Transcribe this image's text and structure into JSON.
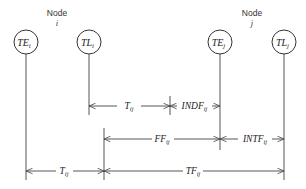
{
  "nodes": [
    {
      "id": "i",
      "label": "Node",
      "sub": "i"
    },
    {
      "id": "j",
      "label": "Node",
      "sub": "j"
    }
  ],
  "events": [
    {
      "id": "TE_i",
      "main": "TE",
      "sub": "i"
    },
    {
      "id": "TL_i",
      "main": "TL",
      "sub": "i"
    },
    {
      "id": "TE_j",
      "main": "TE",
      "sub": "j"
    },
    {
      "id": "TL_j",
      "main": "TL",
      "sub": "j"
    }
  ],
  "dimensions": [
    {
      "id": "T_ij_top",
      "main": "T",
      "sub": "ij",
      "from": "TL_i",
      "to": "INDF_split"
    },
    {
      "id": "INDF_ij",
      "main": "INDF",
      "sub": "ij",
      "from": "INDF_split",
      "to": "TE_j"
    },
    {
      "id": "FF_ij",
      "main": "FF",
      "sub": "ij",
      "from": "FF_start",
      "to": "TE_j"
    },
    {
      "id": "INTF_ij",
      "main": "INTF",
      "sub": "ij",
      "from": "TE_j",
      "to": "TL_j"
    },
    {
      "id": "T_ij_bottom",
      "main": "T",
      "sub": "ij",
      "from": "TE_i",
      "to": "FF_start"
    },
    {
      "id": "TF_ij",
      "main": "TF",
      "sub": "ij",
      "from": "FF_start",
      "to": "TL_j"
    }
  ],
  "colors": {
    "line": "#555555",
    "text": "#222222",
    "background": "#ffffff"
  }
}
